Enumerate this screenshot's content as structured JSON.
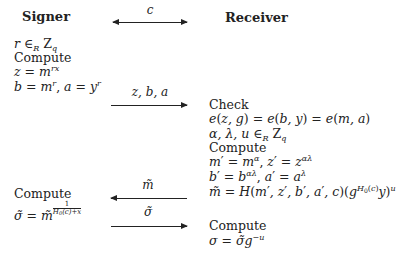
{
  "headers": {
    "signer": "Signer",
    "receiver": "Receiver"
  },
  "arrows": [
    {
      "label": "c",
      "direction": "both"
    },
    {
      "label": "z, b, a",
      "direction": "right"
    },
    {
      "label": "m̃",
      "direction": "left"
    },
    {
      "label": "σ̃",
      "direction": "right"
    }
  ],
  "signer_steps": [
    "r ∈R Zq",
    "Compute",
    "z = m^rx",
    "b = m^r, a = y^r",
    "Compute",
    "σ̃ = m̃^(1/(H0(c)+x))"
  ],
  "receiver_steps": [
    "Check",
    "e(z,g) = e(b,y) = e(m,a)",
    "α, λ, u ∈R Zq",
    "Compute",
    "m′ = m^α, z′ = z^αλ",
    "b′ = b^αλ, a′ = a^λ",
    "m̃ = H(m′,z′,b′,a′,c)(g^H0(c) y)^u",
    "Compute",
    "σ = σ̃ g^−u"
  ],
  "text": {
    "compute": "Compute",
    "check": "Check"
  }
}
